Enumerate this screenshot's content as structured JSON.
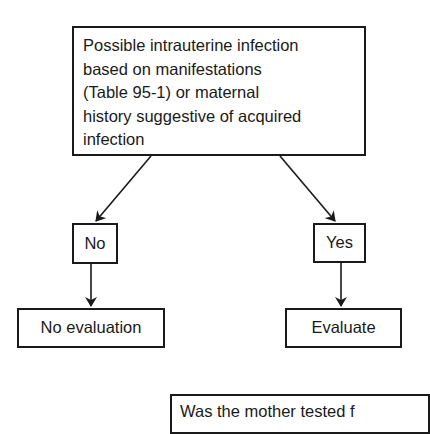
{
  "diagram": {
    "type": "flowchart",
    "nodes": {
      "root": {
        "text": "Possible intrauterine infection\nbased on manifestations\n(Table 95-1) or maternal\nhistory suggestive of acquired\ninfection"
      },
      "no": {
        "text": "No"
      },
      "yes": {
        "text": "Yes"
      },
      "no_evaluation": {
        "text": "No evaluation"
      },
      "evaluate": {
        "text": "Evaluate"
      },
      "next": {
        "text": "Was the mother tested f"
      }
    },
    "edges": [
      {
        "from": "root",
        "to": "no"
      },
      {
        "from": "root",
        "to": "yes"
      },
      {
        "from": "no",
        "to": "no_evaluation"
      },
      {
        "from": "yes",
        "to": "evaluate"
      }
    ],
    "colors": {
      "stroke": "#1a1a1a",
      "background": "#ffffff"
    }
  }
}
